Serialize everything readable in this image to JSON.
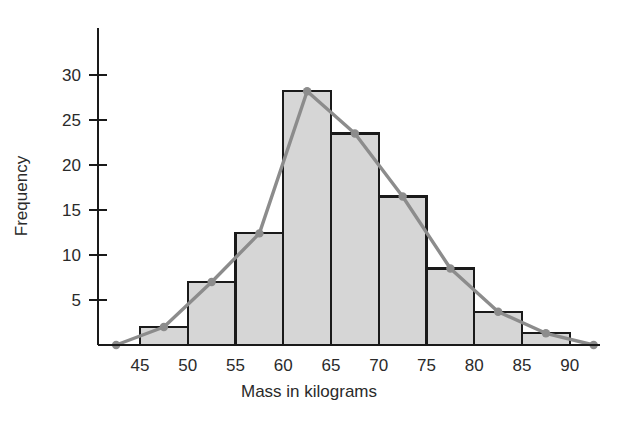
{
  "chart_data": {
    "type": "bar",
    "title": "",
    "xlabel": "Mass in kilograms",
    "ylabel": "Frequency",
    "xlim": [
      40,
      96
    ],
    "ylim": [
      0,
      33
    ],
    "grid": false,
    "legend": "none",
    "bin_width": 5,
    "x_tick_labels": [
      "45",
      "50",
      "55",
      "60",
      "65",
      "70",
      "75",
      "80",
      "85",
      "90"
    ],
    "x_ticks": [
      45,
      50,
      55,
      60,
      65,
      70,
      75,
      80,
      85,
      90
    ],
    "y_tick_labels": [
      "5",
      "10",
      "15",
      "20",
      "25",
      "30"
    ],
    "y_ticks": [
      5,
      10,
      15,
      20,
      25,
      30
    ],
    "categories": [
      "45-50",
      "50-55",
      "55-60",
      "60-65",
      "65-70",
      "70-75",
      "75-80",
      "80-85",
      "85-90",
      "90-95"
    ],
    "bin_edges": [
      45,
      50,
      55,
      60,
      65,
      70,
      75,
      80,
      85,
      90,
      95
    ],
    "values": [
      2,
      7,
      12.4,
      28.2,
      23.5,
      16.5,
      8.5,
      3.7,
      1.3,
      0
    ],
    "series": [
      {
        "name": "Frequency histogram",
        "values": [
          2,
          7,
          12.4,
          28.2,
          23.5,
          16.5,
          8.5,
          3.7,
          1.3,
          0
        ]
      },
      {
        "name": "Frequency polygon",
        "x": [
          42.5,
          47.5,
          52.5,
          57.5,
          62.5,
          67.5,
          72.5,
          77.5,
          82.5,
          87.5,
          92.5
        ],
        "values": [
          0,
          2,
          7,
          12.4,
          28.2,
          23.5,
          16.5,
          8.5,
          3.7,
          1.3,
          0
        ]
      }
    ],
    "colors": {
      "bar_fill": "#d6d6d6",
      "bar_edge": "#1a1a1a",
      "polygon_line": "#8c8c8c",
      "marker": "#8c8c8c",
      "axis": "#1a1a1a",
      "text": "#2a2a2a",
      "background": "#ffffff"
    }
  }
}
